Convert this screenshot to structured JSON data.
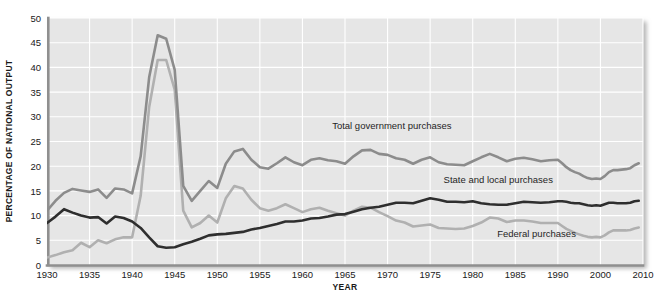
{
  "chart_data": {
    "type": "line",
    "title": "",
    "xlabel": "YEAR",
    "ylabel": "PERCENTAGE OF NATIONAL OUTPUT",
    "ylim": [
      0,
      50
    ],
    "yticks": [
      0,
      5,
      10,
      15,
      20,
      25,
      30,
      35,
      40,
      45,
      50
    ],
    "xticks": [
      "1930",
      "1935",
      "1940",
      "1945",
      "1950",
      "1955",
      "1960",
      "1965",
      "1970",
      "1975",
      "1980",
      "1985",
      "1990",
      "2000",
      "2010"
    ],
    "grid": true,
    "legend_position": "inline-annotations",
    "x": [
      1930,
      1931,
      1932,
      1933,
      1934,
      1935,
      1936,
      1937,
      1938,
      1939,
      1940,
      1941,
      1942,
      1943,
      1944,
      1945,
      1946,
      1947,
      1948,
      1949,
      1950,
      1951,
      1952,
      1953,
      1954,
      1955,
      1956,
      1957,
      1958,
      1959,
      1960,
      1961,
      1962,
      1963,
      1964,
      1965,
      1966,
      1967,
      1968,
      1969,
      1970,
      1971,
      1972,
      1973,
      1974,
      1975,
      1976,
      1977,
      1978,
      1979,
      1980,
      1981,
      1982,
      1983,
      1984,
      1985,
      1986,
      1987,
      1988,
      1989,
      1990,
      1991,
      1992,
      1993,
      1994,
      1995,
      1996,
      1997,
      1998,
      1999,
      2000,
      2001,
      2002,
      2003,
      2004,
      2005,
      2006,
      2007,
      2008,
      2009
    ],
    "series": [
      {
        "name": "Total government purchases",
        "color": "#8c8c8c",
        "label_x": 1970.5,
        "label_y": 27.5,
        "values": [
          11.0,
          13.0,
          14.6,
          15.4,
          15.1,
          14.8,
          15.3,
          13.6,
          15.5,
          15.3,
          14.5,
          22.0,
          38.0,
          46.5,
          45.8,
          39.5,
          16.0,
          13.0,
          15.0,
          17.0,
          15.6,
          20.5,
          23.0,
          23.5,
          21.3,
          19.8,
          19.5,
          20.6,
          21.8,
          20.8,
          20.2,
          21.3,
          21.6,
          21.2,
          21.0,
          20.5,
          22.0,
          23.2,
          23.3,
          22.5,
          22.3,
          21.6,
          21.3,
          20.5,
          21.3,
          21.8,
          20.8,
          20.4,
          20.3,
          20.2,
          21.0,
          21.8,
          22.5,
          21.8,
          21.0,
          21.5,
          21.7,
          21.4,
          21.0,
          21.2,
          21.3,
          20.6,
          19.8,
          19.2,
          18.8,
          18.5,
          18.0,
          17.6,
          17.4,
          17.5,
          17.4,
          18.0,
          18.8,
          19.2,
          19.2,
          19.3,
          19.4,
          19.6,
          20.2,
          20.6
        ]
      },
      {
        "name": "State and local purchases",
        "color": "#2e2e2e",
        "label_x": 1983.0,
        "label_y": 16.6,
        "values": [
          8.5,
          9.8,
          11.3,
          10.6,
          10.0,
          9.6,
          9.7,
          8.4,
          9.8,
          9.5,
          8.8,
          7.5,
          5.6,
          3.8,
          3.5,
          3.6,
          4.2,
          4.7,
          5.3,
          6.0,
          6.2,
          6.3,
          6.5,
          6.7,
          7.2,
          7.5,
          7.9,
          8.3,
          8.8,
          8.8,
          9.0,
          9.4,
          9.5,
          9.8,
          10.2,
          10.3,
          10.8,
          11.3,
          11.6,
          11.8,
          12.2,
          12.6,
          12.6,
          12.5,
          13.0,
          13.5,
          13.2,
          12.8,
          12.8,
          12.7,
          12.9,
          12.5,
          12.3,
          12.2,
          12.2,
          12.5,
          12.8,
          12.7,
          12.6,
          12.7,
          12.9,
          12.9,
          12.8,
          12.6,
          12.5,
          12.5,
          12.3,
          12.1,
          12.0,
          12.1,
          12.0,
          12.3,
          12.6,
          12.6,
          12.5,
          12.5,
          12.5,
          12.6,
          12.9,
          13.0
        ]
      },
      {
        "name": "Federal purchases",
        "color": "#b0b0b0",
        "label_x": 1987.5,
        "label_y": 5.6,
        "values": [
          1.5,
          2.0,
          2.6,
          3.0,
          4.5,
          3.6,
          5.0,
          4.4,
          5.2,
          5.6,
          5.6,
          14.0,
          32.0,
          41.5,
          41.5,
          35.5,
          11.0,
          7.6,
          8.5,
          10.0,
          8.6,
          13.5,
          16.0,
          15.5,
          13.2,
          11.5,
          11.0,
          11.5,
          12.3,
          11.5,
          10.7,
          11.3,
          11.6,
          11.0,
          10.5,
          10.0,
          11.0,
          11.8,
          11.6,
          10.7,
          9.9,
          9.0,
          8.6,
          7.8,
          8.0,
          8.2,
          7.5,
          7.4,
          7.3,
          7.4,
          7.9,
          8.6,
          9.6,
          9.4,
          8.7,
          9.0,
          9.0,
          8.8,
          8.5,
          8.5,
          8.5,
          7.9,
          7.3,
          6.9,
          6.5,
          6.2,
          5.9,
          5.7,
          5.6,
          5.7,
          5.6,
          6.0,
          6.6,
          7.0,
          7.0,
          7.0,
          7.0,
          7.1,
          7.4,
          7.6
        ]
      }
    ]
  },
  "axes": {
    "y_title": "PERCENTAGE OF NATIONAL OUTPUT",
    "x_title": "YEAR"
  },
  "colors": {
    "plot_background": "#e6e6e6",
    "gridline": "#ffffff",
    "axis": "#8f8f8f",
    "total": "#8c8c8c",
    "state_local": "#2e2e2e",
    "federal": "#b0b0b0",
    "text": "#1a1a1a"
  }
}
